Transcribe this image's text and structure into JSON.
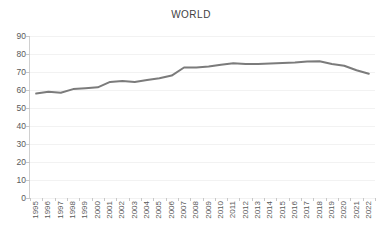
{
  "chart_data": {
    "type": "line",
    "title": "WORLD",
    "xlabel": "",
    "ylabel": "",
    "ylim": [
      0,
      90
    ],
    "yticks": [
      0,
      10,
      20,
      30,
      40,
      50,
      60,
      70,
      80,
      90
    ],
    "grid": true,
    "legend": "none",
    "line_color": "#7b7b7b",
    "categories": [
      "1995",
      "1996",
      "1997",
      "1998",
      "1999",
      "2000",
      "2001",
      "2002",
      "2003",
      "2004",
      "2005",
      "2006",
      "2007",
      "2008",
      "2009",
      "2010",
      "2011",
      "2012",
      "2013",
      "2014",
      "2015",
      "2016",
      "2017",
      "2018",
      "2019",
      "2020",
      "2021",
      "2022"
    ],
    "series": [
      {
        "name": "WORLD",
        "values": [
          58.0,
          59.0,
          58.5,
          60.5,
          61.0,
          61.5,
          64.5,
          65.0,
          64.5,
          65.5,
          66.5,
          68.0,
          72.5,
          72.5,
          73.0,
          74.0,
          74.8,
          74.5,
          74.5,
          74.7,
          75.0,
          75.3,
          75.8,
          76.0,
          74.5,
          73.5,
          71.0,
          69.0
        ]
      }
    ]
  }
}
